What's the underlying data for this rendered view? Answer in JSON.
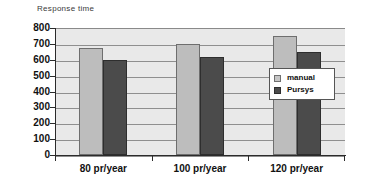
{
  "chart_data": {
    "type": "bar",
    "title": "Response time",
    "xlabel": "",
    "ylabel": "",
    "ylim": [
      0,
      800
    ],
    "ytick_step": 100,
    "yticks": [
      "800",
      "700",
      "600",
      "500",
      "400",
      "300",
      "200",
      "100",
      "0"
    ],
    "grid": true,
    "legend_position": "inside-right",
    "categories": [
      "80 pr/year",
      "100 pr/year",
      "120 pr/year"
    ],
    "series": [
      {
        "name": "manual",
        "color": "#bdbdbd",
        "values": [
          675,
          700,
          750
        ]
      },
      {
        "name": "Pursys",
        "color": "#4b4b4b",
        "values": [
          600,
          620,
          650
        ]
      }
    ]
  },
  "legend": {
    "items": [
      {
        "label": "manual"
      },
      {
        "label": "Pursys"
      }
    ]
  },
  "colors": {
    "plot_background": "#e9e9e9",
    "gridline": "#8f8f8f",
    "axis": "#2b2b2b",
    "manual_bar": "#bdbdbd",
    "pursys_bar": "#4b4b4b",
    "title_text": "#3a3a3a",
    "tick_text": "#111111"
  }
}
